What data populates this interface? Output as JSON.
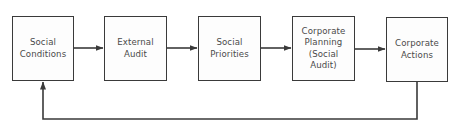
{
  "diagram": {
    "type": "process-flow-with-feedback-loop",
    "nodes": [
      {
        "id": "social-conditions",
        "label": "Social\nConditions",
        "x": 12,
        "y": 16,
        "w": 62,
        "h": 65
      },
      {
        "id": "external-audit",
        "label": "External\nAudit",
        "x": 104,
        "y": 16,
        "w": 63,
        "h": 65
      },
      {
        "id": "social-priorities",
        "label": "Social\nPriorities",
        "x": 198,
        "y": 16,
        "w": 63,
        "h": 65
      },
      {
        "id": "corporate-planning",
        "label": "Corporate\nPlanning\n(Social\nAudit)",
        "x": 292,
        "y": 16,
        "w": 63,
        "h": 65
      },
      {
        "id": "corporate-actions",
        "label": "Corporate\nActions",
        "x": 386,
        "y": 17,
        "w": 62,
        "h": 65
      }
    ],
    "edges": [
      {
        "from": "social-conditions",
        "to": "external-audit"
      },
      {
        "from": "external-audit",
        "to": "social-priorities"
      },
      {
        "from": "social-priorities",
        "to": "corporate-planning"
      },
      {
        "from": "corporate-planning",
        "to": "corporate-actions"
      },
      {
        "from": "corporate-actions",
        "to": "social-conditions",
        "kind": "feedback-loop"
      }
    ],
    "colors": {
      "line": "#3a3a3a",
      "text": "#4a4a4a",
      "background": "#ffffff"
    }
  }
}
